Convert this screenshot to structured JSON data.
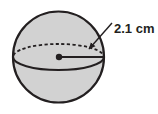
{
  "figure": {
    "name": "sphere-with-radius-label",
    "type": "geometry-diagram",
    "shape": "sphere",
    "background_color": "#ffffff"
  },
  "labels": {
    "radius_label": "2.1 cm"
  },
  "geometry": {
    "sphere": {
      "center_x": 58.5,
      "center_y": 57,
      "radius": 45.5,
      "fill_color": "#d2d2d2",
      "stroke_color": "#231f20",
      "stroke_width": 2.2
    },
    "equator": {
      "center_x": 58.5,
      "center_y": 57,
      "radius_x": 45.5,
      "radius_y": 13,
      "front_style": "solid",
      "back_style": "dashed",
      "dash_pattern": "3.2,2.4",
      "stroke_color": "#231f20",
      "stroke_width": 1.8
    },
    "center_dot": {
      "x": 59,
      "y": 57,
      "radius": 3.2,
      "color": "#231f20"
    },
    "radius_line": {
      "x1": 59,
      "y1": 57,
      "x2": 104,
      "y2": 57,
      "stroke_color": "#231f20",
      "stroke_width": 2.0
    },
    "leader_line": {
      "x1": 112,
      "y1": 23,
      "x2": 88,
      "y2": 50,
      "stroke_color": "#231f20",
      "stroke_width": 1.4
    },
    "arrow_head": {
      "tip_x": 87,
      "tip_y": 51,
      "color": "#231f20"
    }
  }
}
